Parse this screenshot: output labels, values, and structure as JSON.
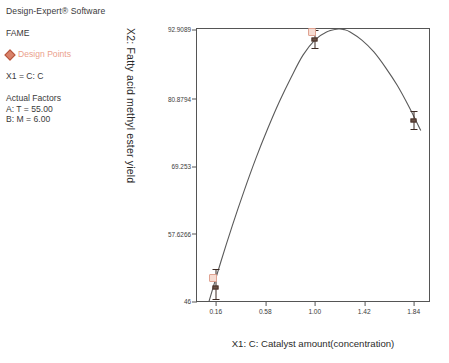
{
  "legend": {
    "software_title": "Design-Expert® Software",
    "response_name": "FAME",
    "design_points_label": "Design Points",
    "design_points_color": "#eb9f8c",
    "x1_line": "X1 = C: C",
    "actual_factors_header": "Actual Factors",
    "actual_factor_a": "A: T = 55.00",
    "actual_factor_b": "B: M = 6.00"
  },
  "chart_data": {
    "type": "line",
    "title": "",
    "xlabel": "X1: C: Catalyst amount(concentration)",
    "ylabel": "X2: Fatty acid methyl ester yield",
    "xlim": [
      0.0,
      1.97
    ],
    "ylim": [
      46,
      92.9089
    ],
    "grid": false,
    "legend_position": "outside-left",
    "x_ticks": [
      "0.16",
      "0.58",
      "1.00",
      "1.42",
      "1.84"
    ],
    "x_tick_values": [
      0.16,
      0.58,
      1.0,
      1.42,
      1.84
    ],
    "y_ticks": [
      "46",
      "57.6266",
      "69.253",
      "80.8794",
      "92.9089"
    ],
    "y_tick_values": [
      46,
      57.6266,
      69.253,
      80.8794,
      92.9089
    ],
    "series": [
      {
        "name": "Predicted model curve",
        "type": "line",
        "color": "#5a5a5a",
        "x": [
          0.1,
          0.2,
          0.3,
          0.4,
          0.5,
          0.6,
          0.7,
          0.8,
          0.9,
          1.0,
          1.1,
          1.2,
          1.25,
          1.3,
          1.4,
          1.5,
          1.6,
          1.7,
          1.8,
          1.9
        ],
        "y": [
          45.8,
          52.6,
          59.0,
          65.0,
          70.6,
          75.7,
          80.4,
          84.6,
          88.4,
          91.0,
          92.4,
          92.9,
          92.8,
          92.4,
          91.0,
          89.0,
          86.3,
          83.2,
          79.5,
          75.4
        ]
      },
      {
        "name": "Design Points",
        "type": "scatter-with-error",
        "color": "#6b5347",
        "points": [
          {
            "x": 0.16,
            "y": 48.3,
            "err_low": 2.0,
            "err_high": 3.2
          },
          {
            "x": 1.0,
            "y": 91.1,
            "err_low": 1.4,
            "err_high": 1.6
          },
          {
            "x": 1.84,
            "y": 77.2,
            "err_low": 1.6,
            "err_high": 1.6
          }
        ]
      },
      {
        "name": "Overlaid design point markers",
        "type": "scatter",
        "color": "#efc9bb",
        "points": [
          {
            "x": 0.135,
            "y": 49.9
          },
          {
            "x": 0.98,
            "y": 92.4
          }
        ]
      }
    ]
  },
  "axis_titles": {
    "y": "X2: Fatty acid methyl ester yield",
    "x": "X1: C: Catalyst amount(concentration)"
  }
}
